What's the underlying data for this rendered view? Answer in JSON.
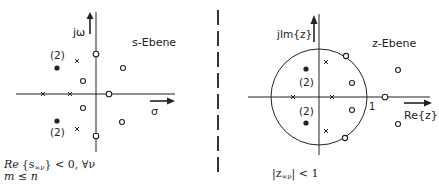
{
  "left_plot": {
    "title": "s-Ebene",
    "y_axis_label": "jω",
    "x_axis_label": "σ",
    "multiplicity_upper": "(2)",
    "multiplicity_lower": "(2)",
    "condition_line1_re": "Re",
    "condition_line1_rest": "{s",
    "condition_line1_sub": "∞ν",
    "condition_line1_end": "} < 0,  ∀ν",
    "condition_line2": "m ≤ n"
  },
  "right_plot": {
    "title": "z-Ebene",
    "y_axis_label": "jIm{z}",
    "x_axis_label": "Re{z}",
    "unit_circle_label": "1",
    "multiplicity_upper": "(2)",
    "multiplicity_lower": "(2)",
    "condition_start": "|z",
    "condition_sub": "∞ν",
    "condition_end": "| < 1"
  },
  "colors": {
    "ink": "#222222",
    "background": "#ffffff"
  }
}
